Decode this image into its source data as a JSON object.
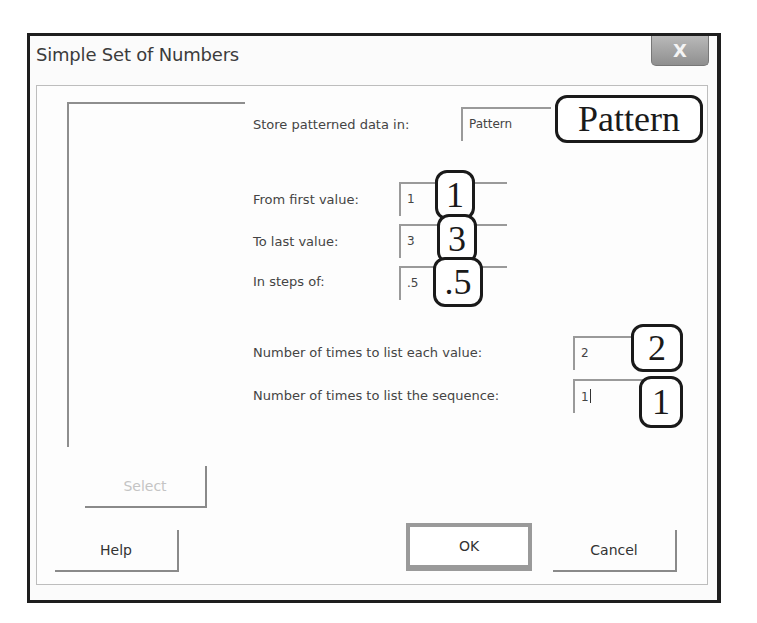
{
  "window": {
    "title": "Simple Set of Numbers",
    "close_icon": "close-icon",
    "close_glyph": "X"
  },
  "form": {
    "store": {
      "label": "Store patterned data in:",
      "value": "Pattern",
      "callout": "Pattern"
    },
    "first_value": {
      "label": "From first value:",
      "value": "1",
      "callout": "1"
    },
    "last_value": {
      "label": "To last value:",
      "value": "3",
      "callout": "3"
    },
    "step": {
      "label": "In steps of:",
      "value": ".5",
      "callout": ".5"
    },
    "times_each": {
      "label": "Number of times to list each value:",
      "value": "2",
      "callout": "2"
    },
    "times_sequence": {
      "label": "Number of times to list the sequence:",
      "value": "1",
      "callout": "1"
    }
  },
  "buttons": {
    "select": "Select",
    "help": "Help",
    "ok": "OK",
    "cancel": "Cancel"
  }
}
